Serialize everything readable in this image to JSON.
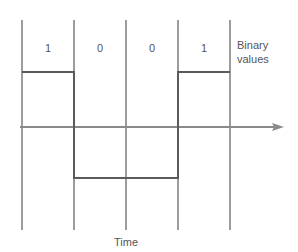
{
  "diagram": {
    "title_label": "Binary values",
    "label_line1": "Binary",
    "label_line2": "values",
    "axis_label": "Time",
    "bits": [
      "1",
      "0",
      "0",
      "1"
    ],
    "colors": {
      "line": "#5a5a5a",
      "axis": "#8a8a8a",
      "text": "#555555"
    }
  }
}
